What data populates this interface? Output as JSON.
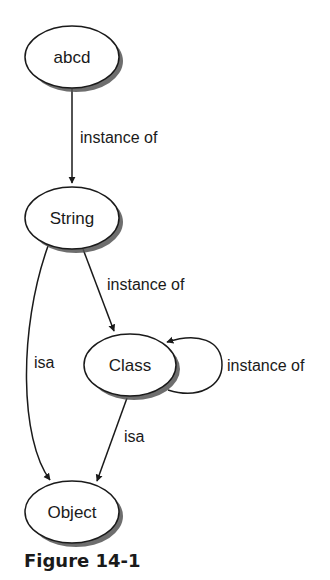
{
  "diagram": {
    "nodes": [
      {
        "id": "abcd",
        "label": "abcd"
      },
      {
        "id": "string",
        "label": "String"
      },
      {
        "id": "class",
        "label": "Class"
      },
      {
        "id": "object",
        "label": "Object"
      }
    ],
    "edges": [
      {
        "from": "abcd",
        "to": "string",
        "label": "instance of"
      },
      {
        "from": "string",
        "to": "class",
        "label": "instance of"
      },
      {
        "from": "string",
        "to": "object",
        "label": "isa"
      },
      {
        "from": "class",
        "to": "class",
        "label": "instance of"
      },
      {
        "from": "class",
        "to": "object",
        "label": "isa"
      }
    ]
  },
  "caption": "Figure 14-1",
  "colors": {
    "stroke": "#1a1a1a",
    "shadow": "#555555",
    "fill": "#ffffff"
  }
}
